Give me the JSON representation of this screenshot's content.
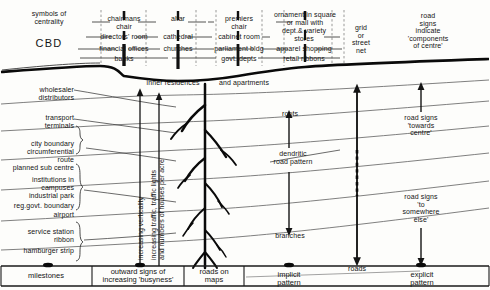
{
  "diagram": {
    "cbd_label": "CBD",
    "left_header": "symbols of\ncentrality",
    "skyline_columns": [
      {
        "name": "corporate",
        "rows": [
          "chairmans\nchair",
          "directors' room",
          "financial offices",
          "banks"
        ]
      },
      {
        "name": "religious",
        "rows": [
          "altar",
          "cathedral",
          "churches",
          ""
        ]
      },
      {
        "name": "government",
        "rows": [
          "premiers\nchair",
          "cabinet room",
          "parliament bldg",
          "govt. depts"
        ]
      },
      {
        "name": "retail",
        "rows": [
          "ornament in square\nor mall with",
          "dept.& variety\nstores",
          "apparel shopping",
          "retail ribbons"
        ]
      },
      {
        "name": "pattern",
        "rows": [
          "grid\nor\nstreet\nnet",
          "",
          "",
          ""
        ]
      }
    ],
    "top_right_note": "road\nsigns\nindicate\n'components\nof centre'",
    "inner_band": {
      "left": "inner residences",
      "right": "and apartments"
    },
    "left_items": [
      "wholesaler\ndistributors",
      "transport\nterminals",
      "city boundary",
      "circumferential\nroute",
      "planned sub centre",
      "institutions in\ncampuses",
      "industrial park",
      "reg.govt. boundary",
      "airport",
      "service station\nribbon",
      "hamburger strip"
    ],
    "vertical_axis_labels": [
      "increasing  verticality",
      "increasing traffic, traffic lights\nand numbers of houses per acre"
    ],
    "tree_annotations": {
      "roots": "roots",
      "pattern": "dendritic\nroad  pattern",
      "branches": "branches"
    },
    "right_annotations": [
      "road  signs\n'towards\ncentre'",
      "road  signs\n'to\nsomewhere\nelse'"
    ],
    "roads_label": "roads",
    "footer_cells": [
      "milestones",
      "outward  signs  of\nincreasing 'busyness'",
      "roads on\nmaps",
      "implicit\npattern",
      "explicit\npattern"
    ]
  },
  "colors": {
    "ink": "#141414",
    "paper": "#fdfdfb",
    "rule": "#333333",
    "faint": "#6d6d6d"
  }
}
